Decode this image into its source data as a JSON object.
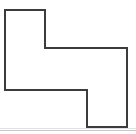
{
  "figure": {
    "background_color": "#ffffff",
    "stroke_color": "#3c3c3c",
    "stroke_width": 2,
    "fill_color": "#ffffff",
    "canvas": {
      "width": 136,
      "height": 134
    },
    "shape": {
      "name": "z-step-polygon",
      "vertex_count": 8,
      "points": [
        {
          "x": 5,
          "y": 10
        },
        {
          "x": 45,
          "y": 10
        },
        {
          "x": 45,
          "y": 48
        },
        {
          "x": 127,
          "y": 48
        },
        {
          "x": 127,
          "y": 127
        },
        {
          "x": 87,
          "y": 127
        },
        {
          "x": 87,
          "y": 90
        },
        {
          "x": 5,
          "y": 90
        }
      ],
      "points_attr": "5,10 45,10 45,48 127,48 127,127 87,127 87,90 5,90"
    }
  },
  "footer": {
    "rule_color": "#c9c9c9",
    "rule_faint_color": "#e2e2e2",
    "rule_y": 130,
    "rule_faint_y": 128
  }
}
